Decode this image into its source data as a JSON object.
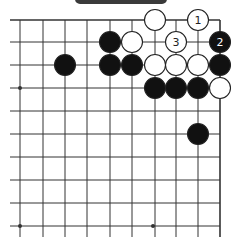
{
  "header": {
    "tab_label": ""
  },
  "board": {
    "colors": {
      "line": "#333333",
      "black": "#111111",
      "white": "#ffffff",
      "stone_outline": "#222222"
    },
    "x_lines": [
      20,
      43,
      65,
      87,
      110,
      132,
      155,
      176,
      198,
      220
    ],
    "y_lines": [
      20,
      42,
      65,
      88,
      111,
      134,
      157,
      180,
      203,
      226
    ],
    "h_line_start": 10,
    "v_line_end": 237,
    "stone_radius": 10.5,
    "star_points": [
      [
        20,
        88
      ],
      [
        20,
        226
      ],
      [
        153,
        226
      ]
    ],
    "stones": [
      {
        "col": 6,
        "row": 0,
        "color": "white",
        "label": ""
      },
      {
        "col": 8,
        "row": 0,
        "color": "white",
        "label": "1"
      },
      {
        "col": 4,
        "row": 1,
        "color": "black",
        "label": ""
      },
      {
        "col": 5,
        "row": 1,
        "color": "white",
        "label": ""
      },
      {
        "col": 7,
        "row": 1,
        "color": "white",
        "label": "3"
      },
      {
        "col": 9,
        "row": 1,
        "color": "black",
        "label": "2"
      },
      {
        "col": 2,
        "row": 2,
        "color": "black",
        "label": ""
      },
      {
        "col": 4,
        "row": 2,
        "color": "black",
        "label": ""
      },
      {
        "col": 5,
        "row": 2,
        "color": "black",
        "label": ""
      },
      {
        "col": 6,
        "row": 2,
        "color": "white",
        "label": ""
      },
      {
        "col": 7,
        "row": 2,
        "color": "white",
        "label": ""
      },
      {
        "col": 8,
        "row": 2,
        "color": "white",
        "label": ""
      },
      {
        "col": 9,
        "row": 2,
        "color": "black",
        "label": ""
      },
      {
        "col": 6,
        "row": 3,
        "color": "black",
        "label": ""
      },
      {
        "col": 7,
        "row": 3,
        "color": "black",
        "label": ""
      },
      {
        "col": 8,
        "row": 3,
        "color": "black",
        "label": ""
      },
      {
        "col": 9,
        "row": 3,
        "color": "white",
        "label": ""
      },
      {
        "col": 8,
        "row": 5,
        "color": "black",
        "label": ""
      }
    ]
  }
}
